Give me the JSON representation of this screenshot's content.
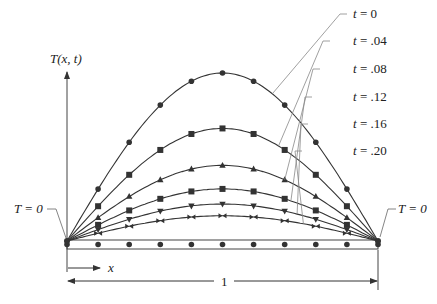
{
  "figure": {
    "axis_label": "T(x, t)",
    "boundary_left": "T = 0",
    "boundary_right": "T = 0",
    "x_label": "x",
    "length_label": "1",
    "colors": {
      "curve": "#333333",
      "leader": "#888888",
      "background": "#ffffff"
    }
  },
  "chart_data": {
    "type": "line",
    "xlabel": "x",
    "ylabel": "T(x, t)",
    "xlim": [
      0,
      1
    ],
    "x": [
      0,
      0.1,
      0.2,
      0.3,
      0.4,
      0.5,
      0.6,
      0.7,
      0.8,
      0.9,
      1.0
    ],
    "series": [
      {
        "name": "t = 0",
        "marker": "circle",
        "amplitude": 1.0,
        "values": [
          0,
          0.309,
          0.588,
          0.809,
          0.951,
          1.0,
          0.951,
          0.809,
          0.588,
          0.309,
          0
        ]
      },
      {
        "name": "t = .04",
        "marker": "square",
        "amplitude": 0.67,
        "values": [
          0,
          0.207,
          0.394,
          0.542,
          0.637,
          0.67,
          0.637,
          0.542,
          0.394,
          0.207,
          0
        ]
      },
      {
        "name": "t = .08",
        "marker": "triangle-up",
        "amplitude": 0.45,
        "values": [
          0,
          0.139,
          0.265,
          0.364,
          0.428,
          0.45,
          0.428,
          0.364,
          0.265,
          0.139,
          0
        ]
      },
      {
        "name": "t = .12",
        "marker": "square",
        "amplitude": 0.31,
        "values": [
          0,
          0.096,
          0.182,
          0.251,
          0.295,
          0.31,
          0.295,
          0.251,
          0.182,
          0.096,
          0
        ]
      },
      {
        "name": "t = .16",
        "marker": "triangle-down",
        "amplitude": 0.22,
        "values": [
          0,
          0.068,
          0.129,
          0.178,
          0.209,
          0.22,
          0.209,
          0.178,
          0.129,
          0.068,
          0
        ]
      },
      {
        "name": "t = .20",
        "marker": "bowtie",
        "amplitude": 0.15,
        "values": [
          0,
          0.046,
          0.088,
          0.121,
          0.143,
          0.15,
          0.143,
          0.121,
          0.088,
          0.046,
          0
        ]
      }
    ],
    "legend_labels": [
      "t = 0",
      "t = .04",
      "t = .08",
      "t = .12",
      "t = .16",
      "t = .20"
    ],
    "legend_position": "right, with leader lines to curves",
    "annotations": [
      "T = 0 (left end)",
      "T = 0 (right end)",
      "x",
      "1"
    ],
    "grid": false
  }
}
